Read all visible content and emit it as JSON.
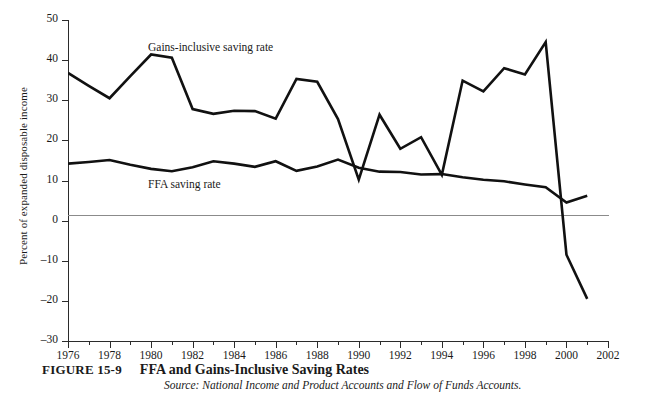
{
  "chart_data": {
    "type": "line",
    "title": "FFA and Gains-Inclusive Saving Rates",
    "xlabel": "",
    "ylabel": "Percent of expanded disposable income",
    "xlim": [
      1976,
      2002
    ],
    "ylim": [
      -30,
      50
    ],
    "grid": false,
    "zero_line": true,
    "legend": "inline-labels",
    "x": [
      1976,
      1977,
      1978,
      1979,
      1980,
      1981,
      1982,
      1983,
      1984,
      1985,
      1986,
      1987,
      1988,
      1989,
      1990,
      1991,
      1992,
      1993,
      1994,
      1995,
      1996,
      1997,
      1998,
      1999,
      2000,
      2001
    ],
    "y_ticks": [
      50,
      40,
      30,
      20,
      10,
      0,
      -10,
      -20,
      -30
    ],
    "y_tick_labels": [
      "50",
      "40",
      "30",
      "20",
      "10",
      "0",
      "–10",
      "–20",
      "–30"
    ],
    "x_ticks_major": [
      1976,
      1978,
      1980,
      1982,
      1984,
      1986,
      1988,
      1990,
      1992,
      1994,
      1996,
      1998,
      2000,
      2002
    ],
    "x_tick_labels": [
      "1976",
      "1978",
      "1980",
      "1982",
      "1984",
      "1986",
      "1988",
      "1990",
      "1992",
      "1994",
      "1996",
      "1998",
      "2000",
      "2002"
    ],
    "x_ticks_minor": [
      1977,
      1979,
      1981,
      1983,
      1985,
      1987,
      1989,
      1991,
      1993,
      1995,
      1997,
      1999,
      2001
    ],
    "series": [
      {
        "name": "Gains-inclusive saving rate",
        "label_text": "Gains-inclusive saving rate",
        "color": "#111111",
        "line_width": 2.6,
        "values": [
          36.8,
          33.6,
          30.5,
          36.0,
          41.4,
          40.6,
          27.8,
          26.6,
          27.4,
          27.3,
          25.4,
          35.3,
          34.6,
          25.3,
          10.2,
          26.4,
          17.9,
          20.8,
          11.4,
          34.9,
          32.2,
          38.0,
          36.4,
          44.5,
          -8.5,
          -19.5
        ]
      },
      {
        "name": "FFA saving rate",
        "label_text": "FFA saving rate",
        "color": "#111111",
        "line_width": 2.6,
        "values": [
          14.2,
          14.6,
          15.1,
          13.9,
          12.9,
          12.3,
          13.3,
          14.8,
          14.2,
          13.4,
          14.8,
          12.4,
          13.5,
          15.2,
          13.2,
          12.2,
          12.1,
          11.5,
          11.6,
          10.8,
          10.2,
          9.8,
          9.0,
          8.3,
          4.5,
          6.2
        ]
      }
    ],
    "annotations": [
      {
        "name": "gains-series-label",
        "text": "Gains-inclusive saving rate",
        "x": 1980.0,
        "y": 43.0
      },
      {
        "name": "ffa-series-label",
        "text": "FFA saving rate",
        "x": 1980.0,
        "y": 8.6
      }
    ]
  },
  "caption": {
    "figure_number": "FIGURE 15-9",
    "title": "FFA and Gains-Inclusive Saving Rates",
    "source": "Source: National Income and Product Accounts and Flow of Funds Accounts."
  }
}
